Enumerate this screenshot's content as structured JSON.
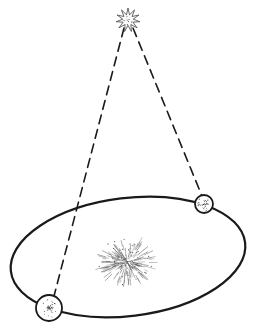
{
  "diagram": {
    "type": "stellar-parallax",
    "colors": {
      "ink": "#1a1a1a",
      "background": "#ffffff",
      "sun_ink": "#555555",
      "star_ink": "#444444"
    },
    "elements": {
      "star": {
        "icon": "star-burst-icon",
        "cx": 128,
        "cy": 20,
        "r": 12
      },
      "orbit": {
        "cx": 128,
        "cy": 257,
        "rx": 118,
        "ry": 59,
        "rotation": -7
      },
      "sun": {
        "icon": "sun-burst-icon",
        "cx": 127,
        "cy": 262,
        "r": 26
      },
      "earth_a": {
        "icon": "earth-globe-icon",
        "cx": 204,
        "cy": 204,
        "r": 9
      },
      "earth_b": {
        "icon": "earth-globe-icon",
        "cx": 49,
        "cy": 308,
        "r": 13
      },
      "sightline_a": {
        "x1": 133,
        "y1": 28,
        "x2": 202,
        "y2": 196
      },
      "sightline_b": {
        "x1": 124,
        "y1": 28,
        "x2": 54,
        "y2": 296
      }
    }
  }
}
